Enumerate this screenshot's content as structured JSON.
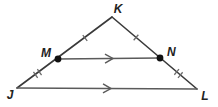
{
  "figure": {
    "type": "geometry-diagram",
    "colors": {
      "background": "#ffffff",
      "side_stroke": "#3a3a3a",
      "inner_stroke": "#5a5a5a",
      "tick_stroke": "#6a6a6a",
      "dot_fill": "#111111",
      "label_fill": "#222222"
    },
    "stroke_width": 1.6,
    "points": {
      "K": {
        "x": 112,
        "y": 17
      },
      "J": {
        "x": 17,
        "y": 88
      },
      "L": {
        "x": 197,
        "y": 89
      },
      "M": {
        "x": 58,
        "y": 59
      },
      "N": {
        "x": 160,
        "y": 58
      }
    },
    "segments": [
      {
        "from": "J",
        "to": "K",
        "role": "side",
        "arrow": false
      },
      {
        "from": "K",
        "to": "L",
        "role": "side",
        "arrow": false
      },
      {
        "from": "J",
        "to": "L",
        "role": "base",
        "arrow": true
      },
      {
        "from": "M",
        "to": "N",
        "role": "midsegment",
        "arrow": true
      }
    ],
    "tick_marks": [
      {
        "from": "K",
        "to": "M",
        "count": 1
      },
      {
        "from": "K",
        "to": "N",
        "count": 1
      },
      {
        "from": "M",
        "to": "J",
        "count": 2
      },
      {
        "from": "N",
        "to": "L",
        "count": 2
      }
    ],
    "dots": [
      "M",
      "N"
    ],
    "labels": [
      {
        "text": "K",
        "x": 118,
        "y": 13,
        "anchor": "middle",
        "size": 12
      },
      {
        "text": "M",
        "x": 51,
        "y": 57,
        "anchor": "end",
        "size": 12
      },
      {
        "text": "N",
        "x": 167,
        "y": 56,
        "anchor": "start",
        "size": 12
      },
      {
        "text": "J",
        "x": 10,
        "y": 99,
        "anchor": "middle",
        "size": 12
      },
      {
        "text": "L",
        "x": 205,
        "y": 100,
        "anchor": "middle",
        "size": 12
      }
    ]
  }
}
